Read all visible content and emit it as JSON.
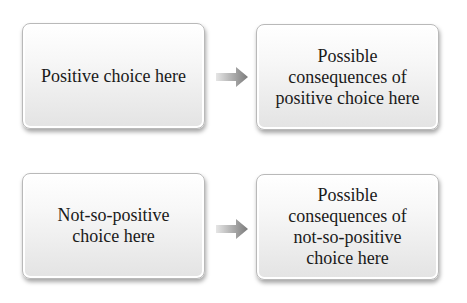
{
  "rows": [
    {
      "choice": "Positive choice here",
      "consequence": "Possible consequences of positive choice here"
    },
    {
      "choice": "Not-so-positive choice here",
      "consequence": "Possible consequences of not-so-positive choice here"
    }
  ],
  "colors": {
    "box_top": "#ffffff",
    "box_bottom": "#e3e3e3",
    "arrow": "#8a8a8a",
    "text": "#1a1a1a"
  }
}
